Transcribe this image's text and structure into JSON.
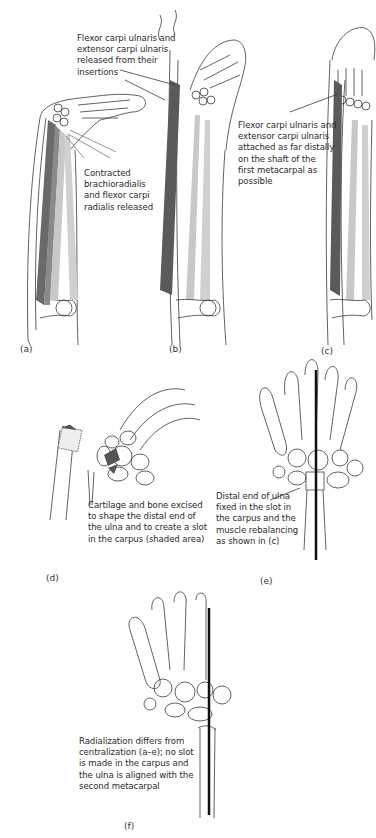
{
  "figure": {
    "panels": [
      {
        "id": "a",
        "label": "(a)",
        "caption": "Contracted brachioradialis and flexor carpi radialis released"
      },
      {
        "id": "b",
        "label": "(b)",
        "caption": "Flexor carpi ulnaris and extensor carpi ulnaris released from their insertions"
      },
      {
        "id": "c",
        "label": "(c)",
        "caption": "Flexor carpi ulnaris and extensor carpi ulnaris attached as far distally on the shaft of the first metacarpal as possible"
      },
      {
        "id": "d",
        "label": "(d)",
        "caption": "Cartilage and bone excised to shape the distal end of the ulna and to create a slot in the carpus (shaded area)"
      },
      {
        "id": "e",
        "label": "(e)",
        "caption": "Distal end of ulna fixed in the slot in the carpus and the muscle rebalancing as shown in (c)"
      },
      {
        "id": "f",
        "label": "(f)",
        "caption": "Radialization differs from centralization (a–e); no slot is made in the carpus and the ulna is aligned with the second metacarpal"
      }
    ],
    "captions_lines": {
      "a": "Contracted\nbrachioradialis\nand flexor carpi\nradialis released",
      "b": "Flexor carpi ulnaris and\nextensor carpi ulnaris\nreleased from their\ninsertions",
      "c": "Flexor carpi ulnaris and\nextensor carpi ulnaris\nattached as far distally\non the shaft of the\nfirst metacarpal as\npossible",
      "d": "Cartilage and bone excised\nto shape the distal end of\nthe ulna and to create a slot\nin the carpus (shaded area)",
      "e": "Distal end of ulna\nfixed in the slot in\nthe carpus and the\nmuscle rebalancing\nas shown in (c)",
      "f": "Radialization differs from\ncentralization (a–e); no slot\nis made in the carpus and\nthe ulna is aligned with the\nsecond metacarpal"
    },
    "colors": {
      "outline": "#3a3a3a",
      "muscle_dark": "#5a5a5a",
      "muscle_light": "#c8c8c8",
      "rod": "#111111",
      "background": "#ffffff"
    }
  }
}
